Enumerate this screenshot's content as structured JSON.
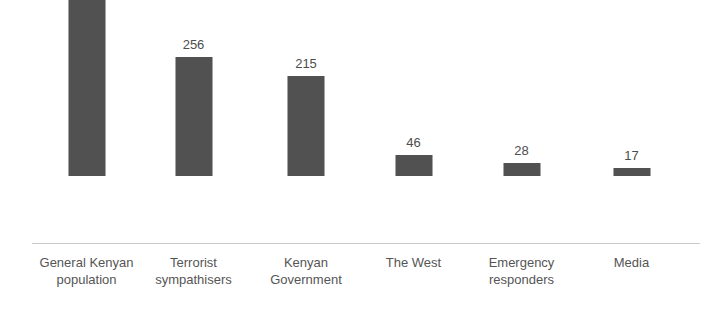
{
  "chart_data": {
    "type": "bar",
    "title": "",
    "subtitle": "",
    "xlabel": "",
    "ylabel": "",
    "ylim": [
      0,
      460
    ],
    "grid": false,
    "legend": null,
    "axis": {
      "baseline_visible": true,
      "y_axis_visible": false,
      "tick_labels": []
    },
    "categories": [
      "General Kenyan population",
      "Terrorist sympathisers",
      "Kenyan Government",
      "The West",
      "Emergency responders",
      "Media"
    ],
    "values": [
      441,
      256,
      215,
      46,
      28,
      17
    ],
    "value_labels": [
      "441",
      "256",
      "215",
      "46",
      "28",
      "17"
    ],
    "bars": [
      {
        "label_line1": "General Kenyan",
        "label_line2": "population",
        "value": 441,
        "value_label": "441",
        "center_x": 86.5
      },
      {
        "label_line1": "Terrorist",
        "label_line2": "sympathisers",
        "value": 256,
        "value_label": "256",
        "center_x": 193.5
      },
      {
        "label_line1": "Kenyan",
        "label_line2": "Government",
        "value": 215,
        "value_label": "215",
        "center_x": 306
      },
      {
        "label_line1": "The West",
        "label_line2": "",
        "value": 46,
        "value_label": "46",
        "center_x": 413.5
      },
      {
        "label_line1": "Emergency",
        "label_line2": "responders",
        "value": 28,
        "value_label": "28",
        "center_x": 521.5
      },
      {
        "label_line1": "Media",
        "label_line2": "",
        "value": 17,
        "value_label": "17",
        "center_x": 631.5
      }
    ],
    "colors": {
      "bar_fill": "#484848",
      "axis_line": "#c9c9c9",
      "label_text": "#555555",
      "value_text": "#4d4d4d",
      "background": "#ffffff"
    }
  }
}
